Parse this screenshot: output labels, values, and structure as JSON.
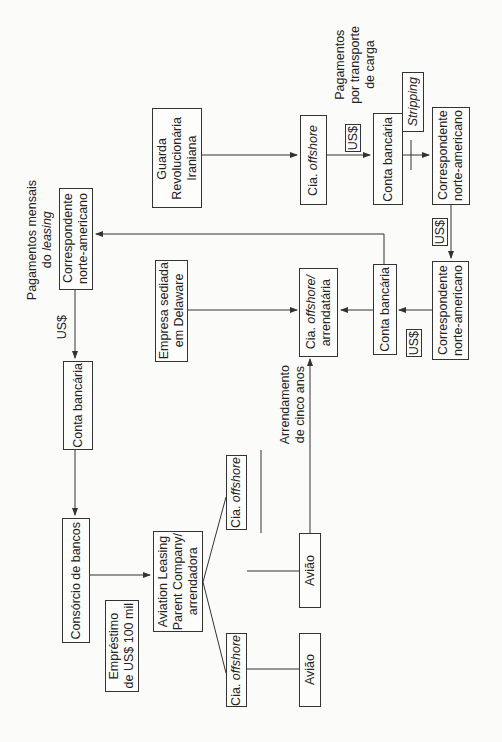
{
  "diagram": {
    "orientation": "rotated 90deg counter-clockwise; text reads bottom-to-top",
    "nodes": {
      "guarda": {
        "line1": "Guarda",
        "line2": "Revolucionária",
        "line3": "Iraniana"
      },
      "cia_offshore_top": {
        "prefix": "Cia. ",
        "italic": "offshore"
      },
      "conta_top": {
        "text": "Conta bancária"
      },
      "stripping": {
        "text": "Stripping"
      },
      "corresp_top": {
        "line1": "Correspondente",
        "line2": "norte-americano"
      },
      "corresp_left": {
        "line1": "Correspondente",
        "line2": "norte-americano"
      },
      "conta_left": {
        "text": "Conta bancária"
      },
      "empresa_delaware": {
        "line1": "Empresa sediada",
        "line2": "em Delaware"
      },
      "cia_arrendataria": {
        "prefix": "Cia. ",
        "italic": "offshore/",
        "line2": "arrendatária"
      },
      "conta_mid": {
        "text": "Conta bancária"
      },
      "corresp_bottom": {
        "line1": "Correspondente",
        "line2": "norte-americano"
      },
      "consorcio": {
        "text": "Consórcio de bancos"
      },
      "aviation": {
        "line1": "Aviation Leasing",
        "line2": "Parent Company/",
        "line3": "arrendadora"
      },
      "emprestimo": {
        "line1": "Empréstimo",
        "line2": "de US$ 100 mil"
      },
      "cia_offshore_a": {
        "prefix": "Cia. ",
        "italic": "offshore"
      },
      "cia_offshore_b": {
        "prefix": "Cia. ",
        "italic": "offshore"
      },
      "aviao_a": {
        "text": "Avião"
      },
      "aviao_b": {
        "text": "Avião"
      }
    },
    "labels": {
      "pag_transporte": {
        "line1": "Pagamentos",
        "line2": "por transporte",
        "line3": "de carga"
      },
      "pag_leasing": {
        "line1": "Pagamentos mensais",
        "line2_prefix": "do ",
        "line2_italic": "leasing"
      },
      "usd_top": "US$",
      "usd_right": "US$",
      "usd_left": "US$",
      "usd_mid": "US$",
      "arrendamento": {
        "line1": "Arrendamento",
        "line2": "de cinco anos"
      }
    },
    "colors": {
      "line": "#333333",
      "background": "#fbfbfa",
      "text": "#222222"
    }
  }
}
